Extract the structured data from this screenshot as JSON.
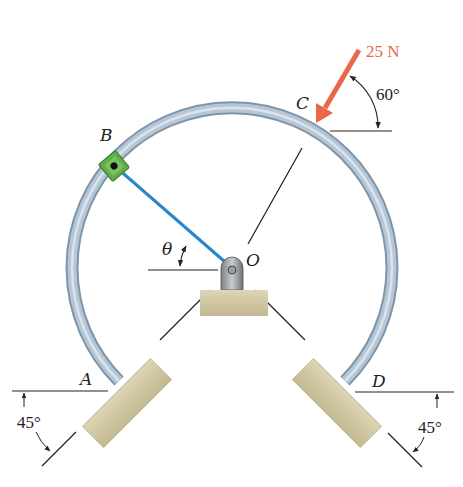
{
  "figure": {
    "points": {
      "A": "A",
      "B": "B",
      "C": "C",
      "D": "D",
      "O": "O"
    },
    "force": {
      "label": "25 N",
      "color": "#e8684a"
    },
    "angles": {
      "force_angle": "60°",
      "theta": "θ",
      "left_support": "45°",
      "right_support": "45°"
    },
    "colors": {
      "ring": "#a9bccd",
      "rod": "#2a86c8",
      "collar": "#5fae48",
      "support": "#cfc5a2"
    }
  }
}
